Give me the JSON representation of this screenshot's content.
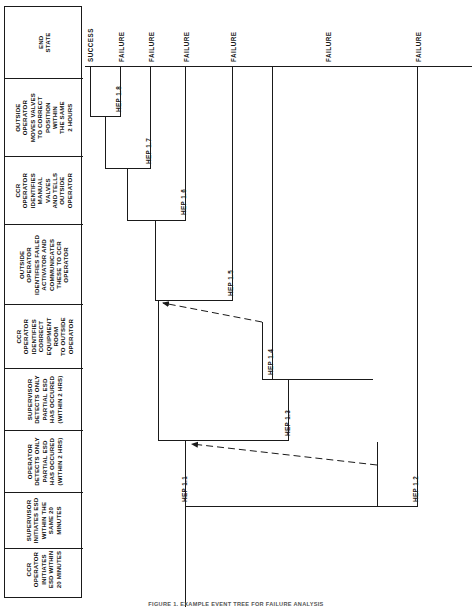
{
  "figure": {
    "caption": "FIGURE 1.  EXAMPLE EVENT TREE FOR FAILURE ANALYSIS",
    "orientation": "rotated-90",
    "line_color": "#1a1a1a"
  },
  "header": {
    "columns": [
      {
        "id": "end-state",
        "lines": [
          "END",
          "STATE"
        ]
      },
      {
        "id": "outside-operator-moves-valves",
        "lines": [
          "OUTSIDE",
          "OPERATOR",
          "MOVES VALVES",
          "TO CORRECT",
          "POSITION",
          "WITHIN",
          "THE SAME",
          "2 HOURS"
        ]
      },
      {
        "id": "ccr-operator-identifies-manual-valves",
        "lines": [
          "CCR",
          "OPERATOR",
          "IDENTIFIES",
          "MANUAL",
          "VALVES",
          "AND TELLS",
          "OUTSIDE",
          "OPERATOR"
        ]
      },
      {
        "id": "outside-operator-identifies-failed-actuator",
        "lines": [
          "OUTSIDE",
          "OPERATOR",
          "IDENTIFIES FAILED",
          "ACTIVATOR AND",
          "COMMUNICATES",
          "THESE TO CCR",
          "OPERATOR"
        ]
      },
      {
        "id": "ccr-operator-identifies-correct-equipment-room",
        "lines": [
          "CCR",
          "OPERATOR",
          "IDENTIFIES",
          "CORRECT",
          "EQUIPMENT",
          "ROOM",
          "TO OUTSIDE",
          "OPERATOR"
        ]
      },
      {
        "id": "supervisor-detects-only-partial-esd",
        "lines": [
          "SUPERVISOR",
          "DETECTS ONLY",
          "PARTIAL ESD",
          "HAS OCCURED",
          "(WITHIN 2 HRS)"
        ]
      },
      {
        "id": "operator-detects-only-partial-esd",
        "lines": [
          "OPERATOR",
          "DETECTS ONLY",
          "PARTIAL ESD",
          "HAS OCCURED",
          "(WITHIN 2 HRS)"
        ]
      },
      {
        "id": "supervisor-initiates-esd",
        "lines": [
          "SUPERVISOR",
          "INITIATES ESD",
          "WITHIN THE",
          "SAME 20",
          "MINUTES"
        ]
      },
      {
        "id": "ccr-operator-initiates-esd",
        "lines": [
          "CCR",
          "OPERATOR",
          "INITIATES",
          "ESD WITHIN",
          "20 MINUTES"
        ]
      },
      {
        "id": "s1-begins-esd-demand",
        "lines": [
          "S1",
          "BEGINS",
          "ESD",
          "DEMAND"
        ]
      }
    ]
  },
  "end_states": [
    {
      "id": "es-1",
      "label": "SUCCESS"
    },
    {
      "id": "es-2",
      "label": "FAILURE"
    },
    {
      "id": "es-3",
      "label": "FAILURE"
    },
    {
      "id": "es-4",
      "label": "FAILURE"
    },
    {
      "id": "es-5",
      "label": "FAILURE"
    },
    {
      "id": "es-6",
      "label": "FAILURE"
    },
    {
      "id": "es-7",
      "label": "FAILURE"
    }
  ],
  "branches": [
    {
      "id": "hep-1-1",
      "label": "HEP 1.1"
    },
    {
      "id": "hep-1-2",
      "label": "HEP 1.2"
    },
    {
      "id": "hep-1-3",
      "label": "HEP 1.3"
    },
    {
      "id": "hep-1-4",
      "label": "HEP 1.4"
    },
    {
      "id": "hep-1-5",
      "label": "HEP 1.5"
    },
    {
      "id": "hep-1-6",
      "label": "HEP 1.6"
    },
    {
      "id": "hep-1-7",
      "label": "HEP 1.7"
    },
    {
      "id": "hep-1-8",
      "label": "HEP 1.8"
    }
  ]
}
